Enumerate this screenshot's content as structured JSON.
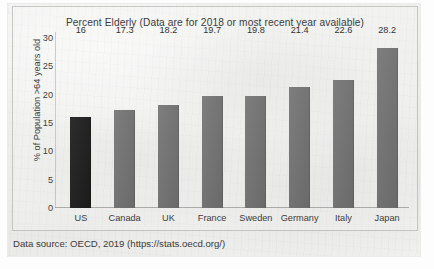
{
  "chart_data": {
    "type": "bar",
    "title": "Percent Elderly (Data are for 2018 or most recent year available)",
    "xlabel": "",
    "ylabel": "% of Population >64 years old",
    "categories": [
      "US",
      "Canada",
      "UK",
      "France",
      "Sweden",
      "Germany",
      "Italy",
      "Japan"
    ],
    "values": [
      16,
      17.3,
      18.2,
      19.7,
      19.8,
      21.4,
      22.6,
      28.2
    ],
    "value_labels": [
      "16",
      "17.3",
      "18.2",
      "19.7",
      "19.8",
      "21.4",
      "22.6",
      "28.2"
    ],
    "ylim": [
      0,
      30
    ],
    "yticks": [
      30,
      25,
      20,
      15,
      10,
      5,
      0
    ],
    "ytick_labels": [
      "30",
      "25",
      "20",
      "15",
      "10",
      "5",
      "0"
    ],
    "grid": false,
    "legend": "none",
    "highlight_index": 0,
    "colors": {
      "bar": "#6f6f6f",
      "bar_highlight": "#1d1d1d",
      "text": "#3b3b3b",
      "axis": "#969696",
      "plot_background": "#eeeeec"
    }
  },
  "source": {
    "note": "Data source: OECD, 2019 (https://stats.oecd.org/)"
  }
}
